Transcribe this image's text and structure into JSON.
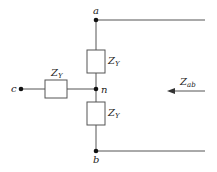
{
  "diagram": {
    "nodes": {
      "a": "a",
      "b": "b",
      "c": "c",
      "n": "n"
    },
    "impedances": {
      "top": {
        "main": "Z",
        "sub": "Y"
      },
      "left": {
        "main": "Z",
        "sub": "Y"
      },
      "bottom": {
        "main": "Z",
        "sub": "Y"
      }
    },
    "measured": {
      "main": "Z",
      "sub": "ab"
    },
    "colors": {
      "wire": "#555555",
      "node": "#111111",
      "text": "#222222"
    }
  }
}
